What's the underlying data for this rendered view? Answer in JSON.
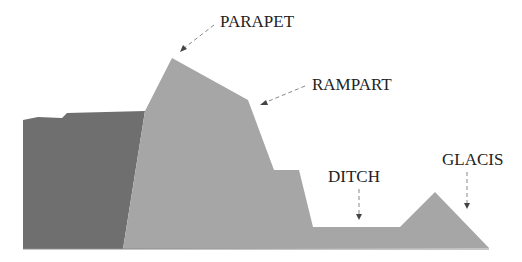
{
  "diagram": {
    "colors": {
      "background": "#ffffff",
      "wall_dark": "#6f6f6f",
      "earthwork_light": "#a6a6a6",
      "label_text": "#222222",
      "arrow": "#888888"
    },
    "labels": [
      {
        "id": "parapet",
        "text": "PARAPET"
      },
      {
        "id": "rampart",
        "text": "RAMPART"
      },
      {
        "id": "ditch",
        "text": "DITCH"
      },
      {
        "id": "glacis",
        "text": "GLACIS"
      }
    ]
  }
}
